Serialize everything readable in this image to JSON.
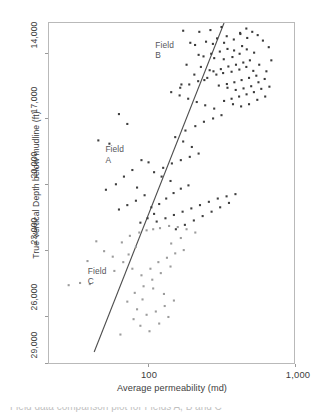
{
  "figure": {
    "caption_partial": "Field data comparison plot for Fields A, B and C"
  },
  "chart_data": {
    "type": "scatter",
    "title": "",
    "xlabel": "Average permeability (md)",
    "ylabel": "True Vertical Depth below mudline (ft)",
    "x_scale": "log",
    "y_scale": "linear",
    "y_inverted": true,
    "xlim": [
      33,
      1200
    ],
    "ylim": [
      14000,
      29500
    ],
    "grid": false,
    "legend": "none",
    "x_ticks": [
      {
        "value": 100,
        "label": "100"
      },
      {
        "value": 1000,
        "label": "1,000"
      }
    ],
    "y_ticks": [
      {
        "value": 14000,
        "label": "14,000"
      },
      {
        "value": 17000,
        "label": "17,000"
      },
      {
        "value": 20000,
        "label": "20,000"
      },
      {
        "value": 23000,
        "label": "23,000"
      },
      {
        "value": 26000,
        "label": "26,000"
      },
      {
        "value": 29000,
        "label": "29,000"
      }
    ],
    "annotations": [
      {
        "name": "field-b-label",
        "text": "Field\nB",
        "x": 155,
        "y": 14750
      },
      {
        "name": "field-a-label",
        "text": "Field\nA",
        "x": 75,
        "y": 19500
      },
      {
        "name": "field-c-label",
        "text": "Field\nC",
        "x": 58,
        "y": 25000
      }
    ],
    "trend_line": {
      "name": "regression-line",
      "color": "#4d4d4d",
      "x0": 64,
      "y0": 29000,
      "x1": 430,
      "y1": 14000
    },
    "series": [
      {
        "name": "Field B",
        "color": "#3a3a3a",
        "marker": "dot",
        "points": [
          [
            236,
            14350
          ],
          [
            299,
            14400
          ],
          [
            352,
            14320
          ],
          [
            414,
            14180
          ],
          [
            447,
            14600
          ],
          [
            388,
            14700
          ],
          [
            330,
            14850
          ],
          [
            281,
            15000
          ],
          [
            365,
            14950
          ],
          [
            430,
            14900
          ],
          [
            496,
            14750
          ],
          [
            546,
            14500
          ],
          [
            604,
            14680
          ],
          [
            560,
            15050
          ],
          [
            498,
            15250
          ],
          [
            452,
            15180
          ],
          [
            404,
            15300
          ],
          [
            356,
            15400
          ],
          [
            318,
            15520
          ],
          [
            372,
            15600
          ],
          [
            428,
            15650
          ],
          [
            486,
            15550
          ],
          [
            540,
            15400
          ],
          [
            600,
            15200
          ],
          [
            668,
            15350
          ],
          [
            628,
            15700
          ],
          [
            570,
            15800
          ],
          [
            512,
            15900
          ],
          [
            458,
            15980
          ],
          [
            410,
            16100
          ],
          [
            368,
            16200
          ],
          [
            424,
            16280
          ],
          [
            480,
            16220
          ],
          [
            538,
            16120
          ],
          [
            596,
            16000
          ],
          [
            660,
            16180
          ],
          [
            720,
            15900
          ],
          [
            690,
            16400
          ],
          [
            620,
            16500
          ],
          [
            556,
            16600
          ],
          [
            500,
            16700
          ],
          [
            448,
            16780
          ],
          [
            398,
            16850
          ],
          [
            452,
            16950
          ],
          [
            510,
            17050
          ],
          [
            572,
            16980
          ],
          [
            640,
            16880
          ],
          [
            712,
            16700
          ],
          [
            780,
            16550
          ],
          [
            742,
            17000
          ],
          [
            666,
            17150
          ],
          [
            598,
            17250
          ],
          [
            536,
            17350
          ],
          [
            480,
            17450
          ],
          [
            430,
            17550
          ],
          [
            490,
            17700
          ],
          [
            552,
            17800
          ],
          [
            620,
            17700
          ],
          [
            700,
            17500
          ],
          [
            786,
            17350
          ],
          [
            836,
            16900
          ],
          [
            800,
            16200
          ],
          [
            860,
            15700
          ],
          [
            828,
            15100
          ],
          [
            760,
            14800
          ],
          [
            704,
            14550
          ],
          [
            650,
            14400
          ],
          [
            596,
            14250
          ],
          [
            544,
            14450
          ],
          [
            262,
            14900
          ],
          [
            296,
            15450
          ],
          [
            248,
            15900
          ],
          [
            278,
            16350
          ],
          [
            322,
            16600
          ],
          [
            230,
            16800
          ]
        ]
      },
      {
        "name": "Field A",
        "color": "#3f3f3f",
        "marker": "dot",
        "points": [
          [
            92,
            18150
          ],
          [
            104,
            18600
          ],
          [
            68,
            19350
          ],
          [
            80,
            19500
          ],
          [
            128,
            20250
          ],
          [
            142,
            20350
          ],
          [
            112,
            20700
          ],
          [
            99,
            21000
          ],
          [
            88,
            21350
          ],
          [
            76,
            21600
          ],
          [
            120,
            21500
          ],
          [
            134,
            21850
          ],
          [
            118,
            22100
          ],
          [
            104,
            22300
          ],
          [
            92,
            22500
          ],
          [
            148,
            22400
          ],
          [
            166,
            22250
          ],
          [
            184,
            22000
          ],
          [
            205,
            21750
          ],
          [
            228,
            21550
          ],
          [
            255,
            21400
          ],
          [
            196,
            21200
          ],
          [
            172,
            21000
          ],
          [
            154,
            20800
          ],
          [
            176,
            20600
          ],
          [
            200,
            20400
          ],
          [
            228,
            20250
          ],
          [
            260,
            20100
          ],
          [
            296,
            19950
          ],
          [
            268,
            19650
          ],
          [
            236,
            19400
          ],
          [
            210,
            19200
          ],
          [
            244,
            18900
          ],
          [
            282,
            18700
          ],
          [
            320,
            18500
          ],
          [
            366,
            18350
          ],
          [
            414,
            18200
          ],
          [
            372,
            17900
          ],
          [
            326,
            17750
          ],
          [
            288,
            17600
          ],
          [
            254,
            17450
          ],
          [
            224,
            17300
          ],
          [
            198,
            17150
          ],
          [
            226,
            16950
          ],
          [
            258,
            16800
          ],
          [
            294,
            16650
          ],
          [
            336,
            16500
          ],
          [
            384,
            16350
          ],
          [
            348,
            16150
          ],
          [
            306,
            16000
          ],
          [
            154,
            22700
          ],
          [
            140,
            22900
          ],
          [
            126,
            23100
          ],
          [
            160,
            23050
          ],
          [
            182,
            22900
          ],
          [
            206,
            22750
          ],
          [
            234,
            22600
          ],
          [
            266,
            22450
          ],
          [
            302,
            22300
          ],
          [
            344,
            22150
          ],
          [
            392,
            22000
          ],
          [
            446,
            21900
          ],
          [
            508,
            21800
          ],
          [
            462,
            22200
          ],
          [
            406,
            22400
          ],
          [
            358,
            22600
          ],
          [
            314,
            22800
          ],
          [
            276,
            23000
          ],
          [
            242,
            23200
          ],
          [
            212,
            23400
          ]
        ]
      },
      {
        "name": "Field C",
        "color": "#9c9c9c",
        "marker": "dot",
        "points": [
          [
            58,
            24850
          ],
          [
            52,
            25850
          ],
          [
            60,
            25900
          ],
          [
            44,
            25950
          ],
          [
            84,
            24650
          ],
          [
            96,
            24000
          ],
          [
            108,
            23700
          ],
          [
            124,
            23550
          ],
          [
            138,
            23450
          ],
          [
            152,
            23400
          ],
          [
            118,
            24200
          ],
          [
            106,
            24550
          ],
          [
            98,
            24900
          ],
          [
            112,
            25200
          ],
          [
            128,
            25500
          ],
          [
            146,
            25200
          ],
          [
            164,
            24900
          ],
          [
            186,
            24700
          ],
          [
            210,
            24500
          ],
          [
            238,
            24350
          ],
          [
            196,
            25100
          ],
          [
            170,
            25400
          ],
          [
            150,
            25700
          ],
          [
            132,
            26000
          ],
          [
            116,
            26300
          ],
          [
            104,
            26700
          ],
          [
            120,
            27050
          ],
          [
            138,
            27300
          ],
          [
            158,
            27150
          ],
          [
            180,
            26900
          ],
          [
            206,
            26650
          ],
          [
            178,
            26350
          ],
          [
            152,
            26100
          ],
          [
            130,
            26600
          ],
          [
            114,
            27500
          ],
          [
            126,
            27800
          ],
          [
            144,
            28050
          ],
          [
            166,
            27700
          ],
          [
            190,
            27400
          ],
          [
            94,
            28200
          ],
          [
            86,
            25300
          ],
          [
            74,
            24400
          ],
          [
            66,
            23950
          ],
          [
            168,
            23350
          ],
          [
            192,
            23250
          ],
          [
            218,
            23300
          ],
          [
            248,
            23400
          ],
          [
            282,
            23550
          ],
          [
            228,
            23800
          ],
          [
            198,
            24050
          ]
        ]
      }
    ]
  }
}
